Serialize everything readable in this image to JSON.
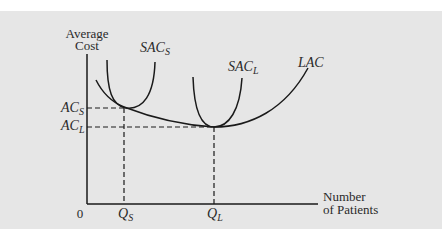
{
  "diagram": {
    "y_axis_label_line1": "Average",
    "y_axis_label_line2": "Cost",
    "x_axis_label_line1": "Number",
    "x_axis_label_line2": "of Patients",
    "origin_label": "0",
    "curves": {
      "sac_s": {
        "base": "SAC",
        "sub": "S"
      },
      "sac_l": {
        "base": "SAC",
        "sub": "L"
      },
      "lac": {
        "base": "LAC",
        "sub": ""
      }
    },
    "y_ticks": {
      "ac_s": {
        "base": "AC",
        "sub": "S"
      },
      "ac_l": {
        "base": "AC",
        "sub": "L"
      }
    },
    "x_ticks": {
      "q_s": {
        "base": "Q",
        "sub": "S"
      },
      "q_l": {
        "base": "Q",
        "sub": "L"
      }
    },
    "colors": {
      "background": "#e6e6e6",
      "line": "#1a1a1a",
      "text": "#2a2a2a"
    }
  }
}
